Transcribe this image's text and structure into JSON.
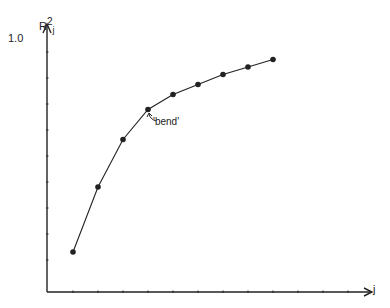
{
  "chart_data": {
    "type": "line",
    "title": "",
    "xlabel": "j",
    "ylabel": "R²j",
    "y_top_label": "1.0",
    "x": [
      1,
      2,
      3,
      4,
      5,
      6,
      7,
      8,
      9
    ],
    "values": [
      0.16,
      0.42,
      0.61,
      0.73,
      0.79,
      0.83,
      0.87,
      0.9,
      0.93
    ],
    "ylim": [
      0,
      1.0
    ],
    "annotations": [
      {
        "text": "'bend'",
        "x": 4,
        "y": 0.73
      }
    ],
    "grid": false,
    "legend": null
  },
  "labels": {
    "y_axis": "R",
    "y_sup": "2",
    "y_sub": "j",
    "y_max": "1.0",
    "x_axis": "j",
    "bend": "'bend'"
  }
}
